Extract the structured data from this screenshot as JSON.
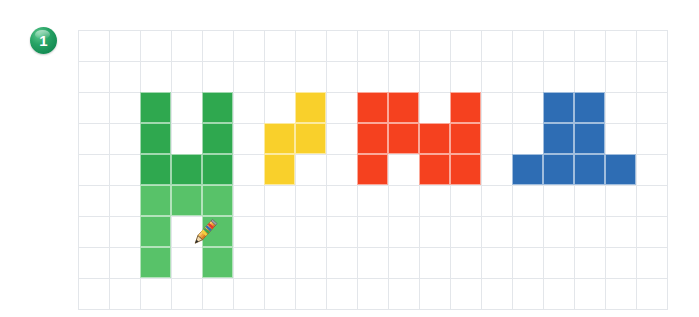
{
  "page": {
    "background_color": "#ffffff"
  },
  "badge": {
    "label": "1",
    "name": "question-number-badge",
    "color": "#27a365",
    "text_color": "#ffffff"
  },
  "grid": {
    "name": "pixel-grid-canvas",
    "origin_x": 78,
    "origin_y": 30,
    "cell_size": 31,
    "columns": 19,
    "rows": 9,
    "line_color": "#e3e6ea",
    "background_color": "#ffffff"
  },
  "cursor": {
    "name": "pencil-cursor",
    "type": "pencil-icon",
    "x": 187,
    "y": 216
  },
  "colors": {
    "green_dark": "#2FA84F",
    "green_light": "#58C269",
    "yellow": "#F9D02B",
    "red": "#F5411F",
    "blue": "#2E6DB4"
  },
  "shapes": [
    {
      "name": "green-h-shape",
      "label": "Green H figure",
      "color": "#2FA84F",
      "secondary_color": "#58C269",
      "cells": [
        {
          "col": 2,
          "row": 2,
          "shade": "dark"
        },
        {
          "col": 4,
          "row": 2,
          "shade": "dark"
        },
        {
          "col": 2,
          "row": 3,
          "shade": "dark"
        },
        {
          "col": 4,
          "row": 3,
          "shade": "dark"
        },
        {
          "col": 2,
          "row": 4,
          "shade": "dark"
        },
        {
          "col": 3,
          "row": 4,
          "shade": "dark"
        },
        {
          "col": 4,
          "row": 4,
          "shade": "dark"
        },
        {
          "col": 2,
          "row": 5,
          "shade": "light"
        },
        {
          "col": 3,
          "row": 5,
          "shade": "light"
        },
        {
          "col": 4,
          "row": 5,
          "shade": "light"
        },
        {
          "col": 2,
          "row": 6,
          "shade": "light"
        },
        {
          "col": 4,
          "row": 6,
          "shade": "light"
        },
        {
          "col": 2,
          "row": 7,
          "shade": "light"
        },
        {
          "col": 4,
          "row": 7,
          "shade": "light"
        }
      ]
    },
    {
      "name": "yellow-s-shape",
      "label": "Yellow S tetromino",
      "color": "#F9D02B",
      "cells": [
        {
          "col": 7,
          "row": 2,
          "shade": "solid"
        },
        {
          "col": 6,
          "row": 3,
          "shade": "solid"
        },
        {
          "col": 7,
          "row": 3,
          "shade": "solid"
        },
        {
          "col": 6,
          "row": 4,
          "shade": "solid"
        }
      ]
    },
    {
      "name": "red-m-shape",
      "label": "Red M figure",
      "color": "#F5411F",
      "cells": [
        {
          "col": 9,
          "row": 2,
          "shade": "solid"
        },
        {
          "col": 10,
          "row": 2,
          "shade": "solid"
        },
        {
          "col": 12,
          "row": 2,
          "shade": "solid"
        },
        {
          "col": 9,
          "row": 3,
          "shade": "solid"
        },
        {
          "col": 10,
          "row": 3,
          "shade": "solid"
        },
        {
          "col": 11,
          "row": 3,
          "shade": "solid"
        },
        {
          "col": 12,
          "row": 3,
          "shade": "solid"
        },
        {
          "col": 9,
          "row": 4,
          "shade": "solid"
        },
        {
          "col": 11,
          "row": 4,
          "shade": "solid"
        },
        {
          "col": 12,
          "row": 4,
          "shade": "solid"
        }
      ]
    },
    {
      "name": "blue-pedestal-shape",
      "label": "Blue pedestal figure",
      "color": "#2E6DB4",
      "cells": [
        {
          "col": 15,
          "row": 2,
          "shade": "solid"
        },
        {
          "col": 16,
          "row": 2,
          "shade": "solid"
        },
        {
          "col": 15,
          "row": 3,
          "shade": "solid"
        },
        {
          "col": 16,
          "row": 3,
          "shade": "solid"
        },
        {
          "col": 14,
          "row": 4,
          "shade": "solid"
        },
        {
          "col": 15,
          "row": 4,
          "shade": "solid"
        },
        {
          "col": 16,
          "row": 4,
          "shade": "solid"
        },
        {
          "col": 17,
          "row": 4,
          "shade": "solid"
        }
      ]
    }
  ]
}
